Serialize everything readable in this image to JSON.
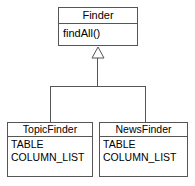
{
  "diagram": {
    "type": "uml-class-diagram",
    "notation": "UML",
    "background_color": "#ffffff",
    "border_color": "#555555",
    "text_color": "#000000",
    "relationship": {
      "kind": "generalization",
      "label": "",
      "arrowhead": "hollow-triangle",
      "parent": "Finder",
      "children": [
        "TopicFinder",
        "NewsFinder"
      ]
    }
  },
  "classes": {
    "finder": {
      "name": "Finder",
      "stereotype": "",
      "members": [
        "findAll()"
      ]
    },
    "topic_finder": {
      "name": "TopicFinder",
      "stereotype": "",
      "members": [
        "TABLE",
        "COLUMN_LIST"
      ]
    },
    "news_finder": {
      "name": "NewsFinder",
      "stereotype": "",
      "members": [
        "TABLE",
        "COLUMN_LIST"
      ]
    }
  }
}
